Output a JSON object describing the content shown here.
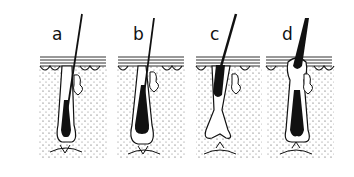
{
  "figure": {
    "panels": [
      {
        "label": "a",
        "x": 38
      },
      {
        "label": "b",
        "x": 116
      },
      {
        "label": "c",
        "x": 194
      },
      {
        "label": "d",
        "x": 266
      }
    ]
  },
  "colors": {
    "ink": "#111111",
    "background": "#ffffff",
    "stipple": "#555555"
  }
}
